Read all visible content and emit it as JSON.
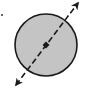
{
  "diagram": {
    "circle": {
      "cx": 46,
      "cy": 45,
      "r": 31,
      "fill": "#c4c4c4",
      "stroke": "#1a1a1a"
    },
    "center_point": {
      "cx": 46,
      "cy": 45
    },
    "diameter_line": {
      "start": {
        "x": 16,
        "y": 85
      },
      "end": {
        "x": 78,
        "y": 3
      },
      "style": "dashed",
      "arrowheads": "both",
      "color": "#1a1a1a"
    },
    "stray_dot": {
      "cx": 2,
      "cy": 15
    },
    "icons": [
      "circle-icon",
      "arrow-up-right-icon",
      "arrow-down-left-icon",
      "center-dot-icon"
    ]
  }
}
